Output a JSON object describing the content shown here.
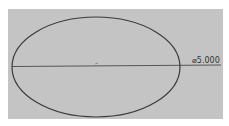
{
  "drawing": {
    "background_color": "#c4c4c4",
    "line_color": "#3a3a3a",
    "shape": "ellipse",
    "dimension": {
      "label": "⌀5.000"
    }
  }
}
